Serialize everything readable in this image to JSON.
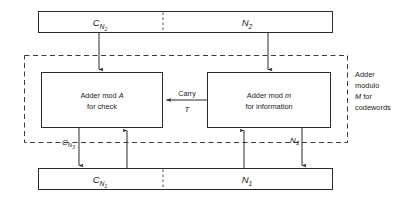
{
  "diagram": {
    "top_bar": {
      "left_label": "C",
      "left_sub": "N",
      "left_sub2": "2",
      "right_label": "N",
      "right_sub": "2"
    },
    "bottom_bar": {
      "left_label": "C",
      "left_sub": "N",
      "left_sub2": "1",
      "right_label": "N",
      "right_sub": "1"
    },
    "left_box": {
      "line1_a": "Adder mod ",
      "line1_b": "A",
      "line2": "for check"
    },
    "right_box": {
      "line1_a": "Adder mod ",
      "line1_b": "m",
      "line2": "for  information"
    },
    "carry": {
      "label": "Carry",
      "symbol": "T"
    },
    "feedback": {
      "check_label": "C",
      "check_sub": "N",
      "check_sub2": "3",
      "info_label": "N",
      "info_sub": "3"
    },
    "boundary_note": {
      "line1": "Adder",
      "line2": "modulo",
      "line3_a": "M",
      "line3_b": " for",
      "line4": "codewords"
    },
    "colors": {
      "stroke": "#2a2a2a",
      "dashed": "#3a3a3a",
      "background": "#ffffff",
      "text": "#1a1a1a"
    }
  }
}
